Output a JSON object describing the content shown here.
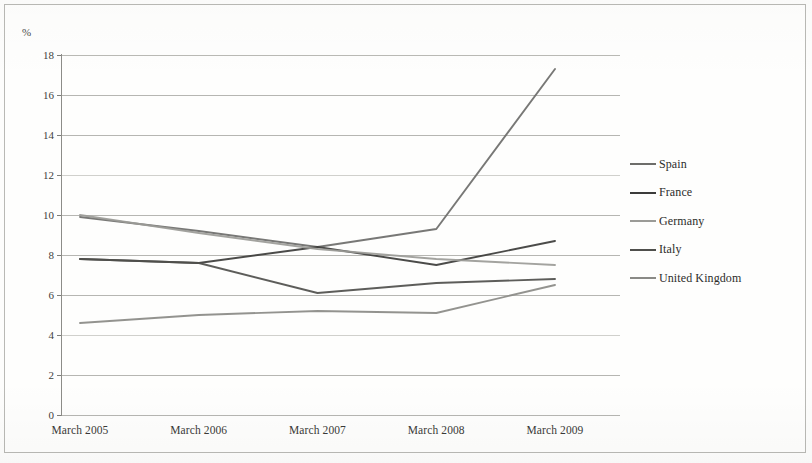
{
  "chart_data": {
    "type": "line",
    "title": "",
    "xlabel": "",
    "ylabel": "%",
    "axis_unit_label": "%",
    "categories": [
      "March 2005",
      "March 2006",
      "March 2007",
      "March 2008",
      "March 2009"
    ],
    "ylim": [
      0,
      18
    ],
    "ytick_step": 2,
    "yticks": [
      "18",
      "16",
      "14",
      "12",
      "10",
      "8",
      "6",
      "4",
      "2",
      "0"
    ],
    "grid": true,
    "legend_position": "right",
    "series": [
      {
        "name": "Spain",
        "values": [
          9.9,
          9.2,
          8.4,
          9.3,
          17.3
        ],
        "color": "#6d6d6a"
      },
      {
        "name": "France",
        "values": [
          7.8,
          7.6,
          8.4,
          7.5,
          8.7
        ],
        "color": "#3c3c3a"
      },
      {
        "name": "Germany",
        "values": [
          10.0,
          9.1,
          8.3,
          7.8,
          7.5
        ],
        "color": "#9b9b97"
      },
      {
        "name": "Italy",
        "values": [
          7.8,
          7.6,
          6.1,
          6.6,
          6.8
        ],
        "color": "#4f4f4c"
      },
      {
        "name": "United Kingdom",
        "values": [
          4.6,
          5.0,
          5.2,
          5.1,
          6.5
        ],
        "color": "#8a8a86"
      }
    ]
  },
  "legend": {
    "items": [
      {
        "label": "Spain"
      },
      {
        "label": "France"
      },
      {
        "label": "Germany"
      },
      {
        "label": "Italy"
      },
      {
        "label": "United Kingdom"
      }
    ]
  }
}
